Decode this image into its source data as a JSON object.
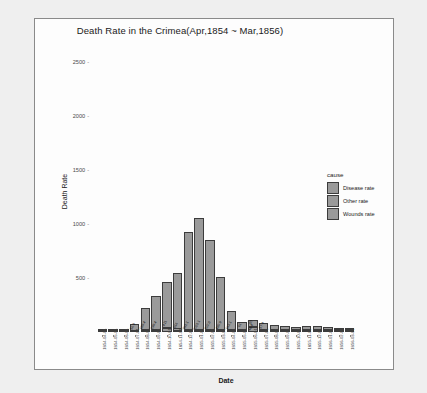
{
  "chart_data": {
    "type": "bar",
    "stacked": true,
    "title": "Death Rate in the Crimea(Apr,1854 ~ Mar,1856)",
    "xlabel": "Date",
    "ylabel": "Death Rate",
    "ylim": [
      0,
      2600
    ],
    "yticks": [
      500,
      1000,
      1500,
      2000,
      2500
    ],
    "grid": false,
    "legend": {
      "title": "cause",
      "position": "right",
      "entries": [
        "Disease rate",
        "Other rate",
        "Wounds rate"
      ]
    },
    "categories": [
      "1854-04-01",
      "1854-05-01",
      "1854-06-01",
      "1854-07-01",
      "1854-08-01",
      "1854-09-01",
      "1854-10-01",
      "1854-11-01",
      "1854-12-01",
      "1855-01-01",
      "1855-02-01",
      "1855-03-01",
      "1855-04-01",
      "1855-05-01",
      "1855-06-01",
      "1855-07-01",
      "1855-08-01",
      "1855-09-01",
      "1855-10-01",
      "1855-11-01",
      "1855-12-01",
      "1856-01-01",
      "1856-02-01",
      "1856-03-01"
    ],
    "series": [
      {
        "name": "Disease rate",
        "values": [
          1.4,
          6.2,
          4.6,
          56.9,
          189.4,
          299.4,
          411.0,
          516.0,
          891.1,
          1023.1,
          822.8,
          480.9,
          163.1,
          61.0,
          50.0,
          57.4,
          37.8,
          30.4,
          17.3,
          21.8,
          26.4,
          18.3,
          3.1,
          3.0
        ]
      },
      {
        "name": "Other rate",
        "values": [
          5.3,
          9.4,
          7.3,
          9.0,
          6.3,
          6.3,
          12.0,
          10.4,
          7.9,
          9.3,
          12.1,
          11.3,
          3.6,
          5.3,
          5.7,
          7.5,
          5.5,
          1.6,
          1.9,
          1.0,
          3.5,
          0.7,
          0.9,
          1.1
        ]
      },
      {
        "name": "Wounds rate",
        "values": [
          0.0,
          0.0,
          0.0,
          0.0,
          0.4,
          13.6,
          36.8,
          22.0,
          20.7,
          16.9,
          11.6,
          13.0,
          11.2,
          14.9,
          48.4,
          19.2,
          6.3,
          1.6,
          0.8,
          1.1,
          0.5,
          0.6,
          0.1,
          0.2
        ]
      }
    ],
    "bar_labels": [
      [
        "1.4",
        "5.3",
        ""
      ],
      [
        "6.2",
        "9.4",
        ""
      ],
      [
        "4.6",
        "7.3",
        ""
      ],
      [
        "56.9",
        "9",
        "0.4"
      ],
      [
        "189.4",
        "6.3",
        "0.4"
      ],
      [
        "299.4",
        "6.3",
        "13.6"
      ],
      [
        "411",
        "12",
        "36.8"
      ],
      [
        "516",
        "10.4",
        "22"
      ],
      [
        "891.1",
        "7.9",
        "20.7"
      ],
      [
        "1023.1",
        "9.3",
        "16.9"
      ],
      [
        "822.8",
        "12.1",
        "11.6"
      ],
      [
        "480.9",
        "11.3",
        "13"
      ],
      [
        "163.1",
        "3.6",
        "11.2"
      ],
      [
        "61",
        "5.3",
        "14.9"
      ],
      [
        "50",
        "5.7",
        "48.4"
      ],
      [
        "57.4",
        "7.5",
        "19.2"
      ],
      [
        "37.8",
        "5.5",
        "6.3"
      ],
      [
        "30.4",
        "1.6",
        "1.6"
      ],
      [
        "17.3",
        "1.9",
        "0.8"
      ],
      [
        "21.8",
        "1",
        "1.1"
      ],
      [
        "26.4",
        "3.5",
        "0.5"
      ],
      [
        "18.3",
        "0.7",
        "0.6"
      ],
      [
        "3.1",
        "0.9",
        "0.1"
      ],
      [
        "3",
        "1.1",
        "0.2"
      ]
    ]
  },
  "colors": {
    "bar_fill": "#9a9a9a",
    "bar_stroke": "#3c3c3c",
    "panel": "#fdfdfd",
    "background": "#efefef"
  }
}
